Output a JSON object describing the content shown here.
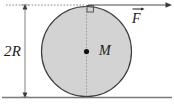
{
  "figure": {
    "labels": {
      "diameter": "2R",
      "mass": "M",
      "force": "F"
    },
    "colors": {
      "disk_fill": "#d4d4d4",
      "disk_stroke": "#3a3a3a",
      "line": "#6b6b6b",
      "ground": "#7a7a7a",
      "text": "#1a1a1a",
      "background": "#ffffff"
    },
    "elements": {
      "disk": {
        "name": "uniform-disk",
        "center_x": 86.5,
        "center_y": 51,
        "radius": 45
      },
      "center_point": {
        "name": "center-of-mass-dot",
        "x": 86.5,
        "y": 51
      },
      "ground_line": {
        "name": "ground-surface",
        "y": 97,
        "x_start": 2,
        "x_end": 172
      },
      "tangent_line": {
        "name": "top-tangent-dotted-line",
        "y": 5,
        "x_start": 6,
        "x_end": 86
      },
      "force_arrow": {
        "name": "force-vector-arrow",
        "y": 5,
        "x_start": 88,
        "x_end": 171,
        "direction": "right"
      },
      "dimension_line": {
        "name": "diameter-dimension-line",
        "x": 25,
        "y_top": 5,
        "y_bottom": 97
      },
      "vertical_axis": {
        "name": "vertical-center-dotted-line",
        "x": 86.5,
        "y_top": 5,
        "y_bottom": 97
      },
      "right_angle_marker": {
        "name": "right-angle-marker",
        "x": 87,
        "y": 5,
        "size": 7
      }
    }
  }
}
